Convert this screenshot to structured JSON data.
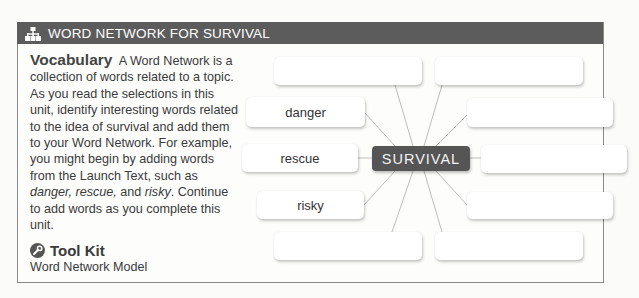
{
  "header": {
    "icon": "network-hierarchy-icon",
    "title": "WORD NETWORK FOR SURVIVAL"
  },
  "vocabulary": {
    "lead": "Vocabulary",
    "text_part1": "A Word Network is a collection of words related to a topic. As you read the selections in this unit, identify interesting words related to the idea of survival and add them to your Word Network. For example, you might begin by adding words from the Launch Text, such as ",
    "italic_words": "danger, rescue,",
    "text_part2": " and ",
    "italic_word2": "risky",
    "text_part3": ". Continue to add words as you complete this unit."
  },
  "toolkit": {
    "icon": "wrench-icon",
    "title": "Tool Kit",
    "subtitle": "Word Network Model"
  },
  "network": {
    "center": "SURVIVAL",
    "nodes": [
      {
        "id": "top-left",
        "label": ""
      },
      {
        "id": "top-right",
        "label": ""
      },
      {
        "id": "danger",
        "label": "danger"
      },
      {
        "id": "upper-right",
        "label": ""
      },
      {
        "id": "rescue",
        "label": "rescue"
      },
      {
        "id": "middle-right",
        "label": ""
      },
      {
        "id": "risky",
        "label": "risky"
      },
      {
        "id": "lower-right",
        "label": ""
      },
      {
        "id": "bottom-left",
        "label": ""
      },
      {
        "id": "bottom-right",
        "label": ""
      }
    ]
  }
}
